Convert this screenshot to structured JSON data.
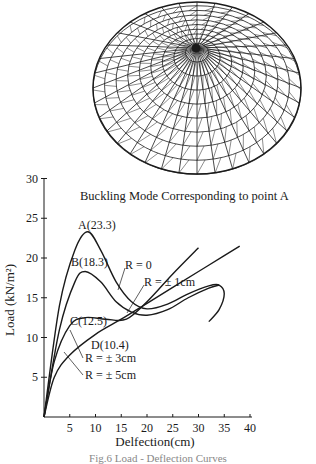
{
  "figure": {
    "subtitle": "Buckling Mode Corresponding to point  A",
    "caption": "Fig.6  Load - Deflection Curves"
  },
  "chart_data": {
    "type": "line",
    "title": "",
    "xlabel": "Delfection(cm)",
    "ylabel": "Load (kN/m²)",
    "xlim": [
      0,
      40
    ],
    "ylim": [
      0,
      30
    ],
    "xticks": [
      5,
      10,
      15,
      20,
      25,
      30,
      35,
      40
    ],
    "yticks": [
      5,
      10,
      15,
      20,
      25,
      30
    ],
    "grid": false,
    "series": [
      {
        "name": "R = 0",
        "x": [
          0,
          3,
          6,
          8.5,
          11,
          14,
          17,
          20,
          24,
          28,
          32,
          34,
          35,
          34,
          32
        ],
        "y": [
          0,
          14,
          21,
          23.3,
          21,
          17,
          14.5,
          13.6,
          14.2,
          15.5,
          16.5,
          16.6,
          15.5,
          13.5,
          12
        ]
      },
      {
        "name": "R = ± 1cm",
        "x": [
          0,
          3,
          6,
          8,
          11,
          14,
          17,
          20,
          24,
          28,
          32,
          34
        ],
        "y": [
          0,
          11,
          17,
          18.3,
          17,
          14.5,
          13.2,
          12.8,
          13.5,
          15,
          16.2,
          16.6
        ]
      },
      {
        "name": "R = ± 3cm",
        "x": [
          0,
          2,
          5,
          8,
          12,
          16,
          20,
          25,
          30
        ],
        "y": [
          0,
          7,
          11.5,
          12.5,
          12.3,
          12.3,
          14.5,
          18,
          21.3
        ]
      },
      {
        "name": "R = ± 5cm",
        "x": [
          0,
          2,
          5,
          10,
          15,
          20,
          25,
          30,
          35,
          38
        ],
        "y": [
          0,
          5,
          7.8,
          10.4,
          12.3,
          14.3,
          16.3,
          18.3,
          20.3,
          21.5
        ]
      }
    ],
    "annotations": [
      {
        "text": "A(23.3)",
        "x": 8.5,
        "y": 23.3
      },
      {
        "text": "B(18.3)",
        "x": 8,
        "y": 18.3
      },
      {
        "text": "C(12.5)",
        "x": 8,
        "y": 12.5
      },
      {
        "text": "D(10.4)",
        "x": 10,
        "y": 10.4
      },
      {
        "text": "R = 0"
      },
      {
        "text": "R = ± 1cm"
      },
      {
        "text": "R = ± 3cm"
      },
      {
        "text": "R = ± 5cm"
      }
    ]
  }
}
